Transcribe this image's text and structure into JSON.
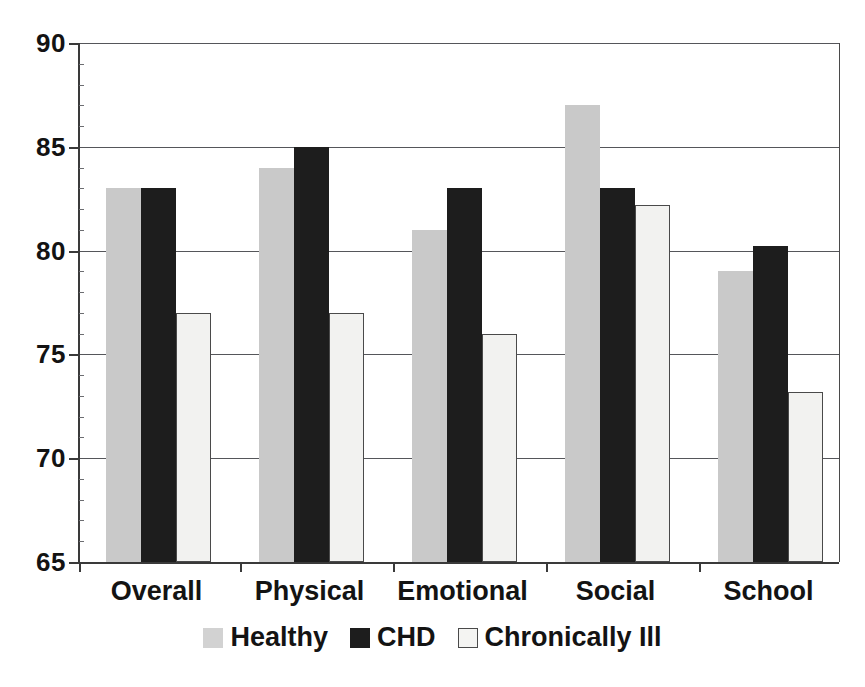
{
  "chart_data": {
    "type": "bar",
    "title": "",
    "xlabel": "",
    "ylabel": "",
    "ylim": [
      65,
      90
    ],
    "yticks": [
      65,
      70,
      75,
      80,
      85,
      90
    ],
    "ytick_labels": [
      "65",
      "70",
      "75",
      "80",
      "85",
      "90"
    ],
    "grid": true,
    "legend_position": "bottom",
    "categories": [
      "Overall",
      "Physical",
      "Emotional",
      "Social",
      "School"
    ],
    "series": [
      {
        "name": "Healthy",
        "color": "#c9c9c9",
        "values": [
          83,
          84,
          81,
          87,
          79
        ]
      },
      {
        "name": "CHD",
        "color": "#1d1d1d",
        "values": [
          83,
          85,
          83,
          83,
          80.2
        ]
      },
      {
        "name": "Chronically Ill",
        "color": "#f2f2f0",
        "values": [
          77,
          77,
          76,
          82.2,
          73.2
        ]
      }
    ]
  },
  "axis": {
    "y_labels": [
      "90",
      "85",
      "80",
      "75",
      "70",
      "65"
    ]
  },
  "legend": {
    "items": [
      {
        "label": "Healthy",
        "swatch": "swatch-light-gray"
      },
      {
        "label": "CHD",
        "swatch": "swatch-black"
      },
      {
        "label": "Chronically Ill",
        "swatch": "swatch-white-outline"
      }
    ]
  }
}
